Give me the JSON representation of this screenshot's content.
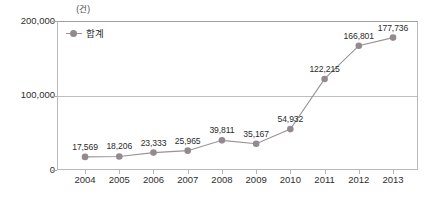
{
  "chart_data": {
    "type": "line",
    "title": "",
    "unit_label": "(건)",
    "xlabel": "",
    "ylabel": "",
    "categories": [
      "2004",
      "2005",
      "2006",
      "2007",
      "2008",
      "2009",
      "2010",
      "2011",
      "2012",
      "2013"
    ],
    "series": [
      {
        "name": "합계",
        "values": [
          17569,
          18206,
          23333,
          25965,
          39811,
          35167,
          54932,
          122215,
          166801,
          177736
        ],
        "value_labels": [
          "17,569",
          "18,206",
          "23,333",
          "25,965",
          "39,811",
          "35,167",
          "54,932",
          "122,215",
          "166,801",
          "177,736"
        ],
        "color": "#938a90",
        "line_color": "#9b9296",
        "marker": "circle"
      }
    ],
    "ylim": [
      0,
      200000
    ],
    "yticks": [
      0,
      100000,
      200000
    ],
    "ytick_labels": [
      "0",
      "100,000",
      "200,000"
    ],
    "grid": true,
    "gridlines_at": [
      100000,
      200000
    ],
    "legend": {
      "position": "top-left-inside",
      "entries": [
        "합계"
      ]
    }
  },
  "legend": {
    "label": "합계"
  },
  "axis": {
    "unit": "(건)"
  },
  "bottom_caption": ""
}
